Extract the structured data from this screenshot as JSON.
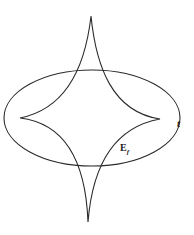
{
  "figure": {
    "labels": {
      "ellipse_label": "t",
      "astroid_label_main": "E",
      "astroid_label_sub": "f"
    },
    "colors": {
      "stroke": "#2b2b2b",
      "background": "#ffffff"
    },
    "ellipse": {
      "cx": 92,
      "cy": 118,
      "rx": 88,
      "ry": 48
    },
    "astroid": {
      "top_cusp": [
        91,
        16
      ],
      "bottom_cusp": [
        88,
        222
      ],
      "left_cusp": [
        20,
        118
      ],
      "right_cusp": [
        160,
        119
      ]
    }
  }
}
